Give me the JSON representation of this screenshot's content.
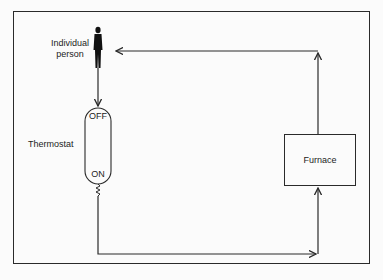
{
  "diagram": {
    "type": "feedback-loop",
    "nodes": {
      "person": {
        "label_line1": "Individual",
        "label_line2": "person",
        "icon": "person-icon"
      },
      "thermostat": {
        "label": "Thermostat",
        "off_label": "OFF",
        "on_label": "ON"
      },
      "furnace": {
        "label": "Furnace"
      }
    },
    "edges": [
      {
        "from": "person",
        "to": "thermostat"
      },
      {
        "from": "thermostat",
        "to": "furnace"
      },
      {
        "from": "furnace",
        "to": "person"
      }
    ],
    "colors": {
      "line": "#2a2a2a",
      "background": "#fbfbfb",
      "text": "#1c1c1c"
    }
  }
}
